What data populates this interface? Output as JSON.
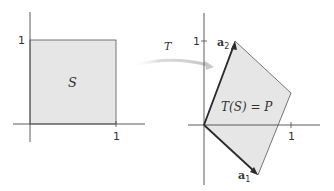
{
  "colors": {
    "axis": "#4a4a4a",
    "region_fill": "#e6e6e6",
    "region_edge": "#555555",
    "vector": "#2b2b2b",
    "arrow": "#d2d2d2",
    "text": "#333333"
  },
  "left_panel": {
    "region_label": "S",
    "x_tick_label": "1",
    "y_tick_label": "1",
    "square": {
      "x0": 0,
      "y0": 0,
      "x1": 1,
      "y1": 1
    }
  },
  "transform": {
    "label": "T"
  },
  "right_panel": {
    "region_label": "T(S) = P",
    "x_tick_label": "1",
    "y_tick_label": "1",
    "vectors": [
      {
        "name": "a",
        "subscript": "1",
        "x": 0.62,
        "y": -0.58
      },
      {
        "name": "a",
        "subscript": "2",
        "x": 0.36,
        "y": 0.98
      }
    ],
    "parallelogram": [
      [
        0,
        0
      ],
      [
        0.62,
        -0.58
      ],
      [
        0.98,
        0.4
      ],
      [
        0.36,
        0.98
      ]
    ]
  }
}
